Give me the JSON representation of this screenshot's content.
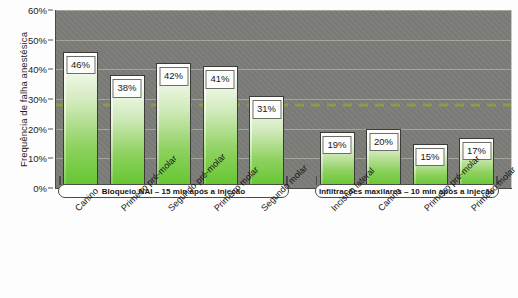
{
  "chart_data": {
    "type": "bar",
    "title": "",
    "subtitle": "",
    "xlabel": "",
    "ylabel": "Frequência de falha anestésica",
    "ylim": [
      0,
      60
    ],
    "y_unit": "%",
    "y_ticks": [
      "0%",
      "10%",
      "20%",
      "30%",
      "40%",
      "50%",
      "60%"
    ],
    "y_tick_values": [
      0,
      10,
      20,
      30,
      40,
      50,
      60
    ],
    "grid": true,
    "legend": "none",
    "categories": [
      "Canino",
      "Primeiro pré-molar",
      "Segundo pré-molar",
      "Primeiro molar",
      "Segundo molar",
      "Incisivo lateral",
      "Canino",
      "Primeiro pré-molar",
      "Primeiro molar"
    ],
    "values": [
      46,
      38,
      42,
      41,
      31,
      19,
      20,
      15,
      17
    ],
    "value_labels": [
      "46%",
      "38%",
      "42%",
      "41%",
      "31%",
      "19%",
      "20%",
      "15%",
      "17%"
    ],
    "groups": [
      {
        "label": "Bloqueio NAI – 15 min após a injeção",
        "start_index": 0,
        "count": 5
      },
      {
        "label": "Infiltrações maxilares – 10 min após a injeção",
        "start_index": 5,
        "count": 4
      }
    ],
    "reference_line": {
      "value": 28,
      "label": "",
      "style": "dashed",
      "color": "#8d9c3c"
    },
    "colors": {
      "plot_background": "#7c7d78",
      "bar_top": "#ffffff",
      "bar_bottom": "#62c62e",
      "bar_outline": "#3b3b38",
      "gridline": "#e1e1d7",
      "reference_line": "#8d9c3c",
      "label_box_background": "#fdfdfb",
      "text": "#1a1a1a"
    }
  }
}
